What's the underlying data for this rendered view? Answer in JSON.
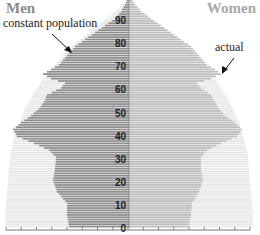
{
  "header": {
    "left_label": "Men",
    "right_label": "Women"
  },
  "annotations": {
    "constant": "constant population",
    "actual": "actual"
  },
  "colors": {
    "men": "#8c8c8c",
    "women": "#bdbdbd",
    "constant_bg": "#e6e6e6",
    "axis": "#555555"
  },
  "chart_data": {
    "type": "bar",
    "orientation": "horizontal-pyramid",
    "title": "",
    "legend": [
      "Men",
      "Women"
    ],
    "annotations": [
      "constant population",
      "actual"
    ],
    "y_ticks": [
      0,
      10,
      20,
      30,
      40,
      50,
      60,
      70,
      80,
      90
    ],
    "ylabel": "Age",
    "ylim": [
      0,
      100
    ],
    "xlabel": "",
    "xlim": [
      -125,
      125
    ],
    "ages": [
      0,
      5,
      10,
      15,
      20,
      25,
      30,
      33,
      36,
      39,
      42,
      45,
      48,
      51,
      54,
      57,
      60,
      62,
      64,
      66,
      68,
      70,
      72,
      75,
      78,
      81,
      84,
      87,
      90,
      93,
      96,
      99
    ],
    "series": [
      {
        "name": "Men (actual)",
        "values": [
          60,
          62,
          62,
          72,
          76,
          74,
          73,
          80,
          95,
          112,
          116,
          108,
          98,
          90,
          85,
          82,
          68,
          64,
          78,
          86,
          78,
          70,
          66,
          60,
          54,
          44,
          34,
          24,
          14,
          8,
          4,
          1
        ]
      },
      {
        "name": "Women (actual)",
        "values": [
          60,
          62,
          63,
          70,
          74,
          72,
          72,
          78,
          92,
          108,
          113,
          106,
          96,
          90,
          86,
          82,
          72,
          68,
          82,
          92,
          86,
          78,
          74,
          68,
          62,
          52,
          42,
          32,
          22,
          12,
          6,
          2
        ]
      },
      {
        "name": "Constant population",
        "values": [
          124,
          124,
          123,
          122,
          121,
          120,
          119,
          118,
          116,
          114,
          112,
          110,
          107,
          104,
          100,
          96,
          92,
          89,
          86,
          82,
          78,
          74,
          70,
          64,
          57,
          49,
          40,
          31,
          22,
          14,
          7,
          2
        ]
      }
    ]
  }
}
